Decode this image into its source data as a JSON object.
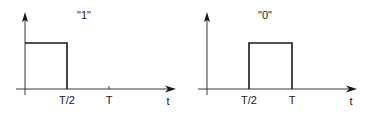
{
  "diagrams": [
    {
      "name": "bit-one",
      "title": "\"1\"",
      "x_axis_label": "t",
      "ticks": [
        {
          "label": "T/2"
        },
        {
          "label": "T"
        }
      ],
      "pulse": {
        "start": "0",
        "end": "T/2"
      }
    },
    {
      "name": "bit-zero",
      "title": "\"0\"",
      "x_axis_label": "t",
      "ticks": [
        {
          "label": "T/2"
        },
        {
          "label": "T"
        }
      ],
      "pulse": {
        "start": "T/2",
        "end": "T"
      }
    }
  ],
  "colors": {
    "line": "#1a1a1a",
    "axis": "#3a3a3a",
    "background": "#ffffff"
  }
}
